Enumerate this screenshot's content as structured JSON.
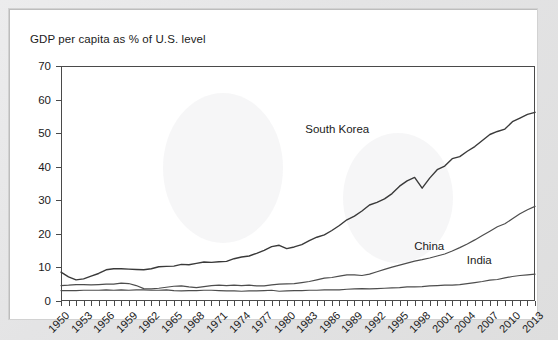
{
  "chart_data": {
    "type": "line",
    "title": "GDP per capita as % of U.S. level",
    "xlabel": "",
    "ylabel": "",
    "ylim": [
      0,
      70
    ],
    "xlim": [
      1950,
      2013
    ],
    "ytick_step": 10,
    "yticks": [
      0,
      10,
      20,
      30,
      40,
      50,
      60,
      70
    ],
    "xticks": [
      1950,
      1953,
      1956,
      1959,
      1962,
      1965,
      1968,
      1971,
      1974,
      1977,
      1980,
      1983,
      1986,
      1989,
      1992,
      1995,
      1998,
      2001,
      2004,
      2007,
      2010,
      2013
    ],
    "xtick_every_year": true,
    "grid": false,
    "legend": "inline-labels",
    "x": [
      1950,
      1951,
      1952,
      1953,
      1954,
      1955,
      1956,
      1957,
      1958,
      1959,
      1960,
      1961,
      1962,
      1963,
      1964,
      1965,
      1966,
      1967,
      1968,
      1969,
      1970,
      1971,
      1972,
      1973,
      1974,
      1975,
      1976,
      1977,
      1978,
      1979,
      1980,
      1981,
      1982,
      1983,
      1984,
      1985,
      1986,
      1987,
      1988,
      1989,
      1990,
      1991,
      1992,
      1993,
      1994,
      1995,
      1996,
      1997,
      1998,
      1999,
      2000,
      2001,
      2002,
      2003,
      2004,
      2005,
      2006,
      2007,
      2008,
      2009,
      2010,
      2011,
      2012,
      2013
    ],
    "series": [
      {
        "name": "South Korea",
        "label_x": 1987,
        "label_y": 51,
        "values": [
          8.6,
          7.2,
          6.3,
          6.6,
          7.4,
          8.2,
          9.3,
          9.6,
          9.6,
          9.5,
          9.4,
          9.3,
          9.6,
          10.2,
          10.3,
          10.4,
          10.9,
          10.8,
          11.2,
          11.6,
          11.5,
          11.7,
          11.8,
          12.6,
          13.1,
          13.4,
          14.2,
          15.1,
          16.2,
          16.6,
          15.6,
          16.1,
          16.8,
          18.0,
          19.0,
          19.7,
          21.0,
          22.5,
          24.2,
          25.3,
          26.8,
          28.6,
          29.4,
          30.4,
          32.0,
          34.2,
          35.8,
          36.8,
          33.6,
          36.6,
          39.1,
          40.2,
          42.4,
          43.0,
          44.6,
          46.0,
          47.8,
          49.6,
          50.5,
          51.2,
          53.4,
          54.5,
          55.6,
          56.2
        ]
      },
      {
        "name": "China",
        "label_x": 1999,
        "label_y": 16,
        "values": [
          4.6,
          4.7,
          4.9,
          4.9,
          4.8,
          4.9,
          5.0,
          5.0,
          5.3,
          5.2,
          4.6,
          3.7,
          3.6,
          3.8,
          4.1,
          4.4,
          4.5,
          4.2,
          4.0,
          4.3,
          4.6,
          4.7,
          4.6,
          4.7,
          4.6,
          4.7,
          4.5,
          4.5,
          4.8,
          5.0,
          5.1,
          5.2,
          5.5,
          5.8,
          6.3,
          6.8,
          7.0,
          7.4,
          7.8,
          7.8,
          7.6,
          8.0,
          8.7,
          9.4,
          10.1,
          10.7,
          11.3,
          11.9,
          12.3,
          12.8,
          13.4,
          14.0,
          14.9,
          15.9,
          17.0,
          18.2,
          19.5,
          20.8,
          22.1,
          23.0,
          24.5,
          26.0,
          27.2,
          28.2
        ]
      },
      {
        "name": "India",
        "label_x": 2006,
        "label_y": 12,
        "values": [
          3.1,
          3.1,
          3.1,
          3.2,
          3.2,
          3.2,
          3.3,
          3.2,
          3.3,
          3.2,
          3.3,
          3.3,
          3.2,
          3.2,
          3.3,
          3.1,
          3.0,
          3.1,
          3.1,
          3.2,
          3.2,
          3.1,
          3.0,
          3.0,
          2.9,
          3.0,
          3.0,
          3.1,
          3.2,
          2.9,
          3.0,
          3.1,
          3.1,
          3.2,
          3.2,
          3.3,
          3.3,
          3.3,
          3.5,
          3.6,
          3.7,
          3.6,
          3.7,
          3.8,
          3.9,
          4.0,
          4.2,
          4.2,
          4.3,
          4.5,
          4.6,
          4.7,
          4.7,
          4.9,
          5.2,
          5.5,
          5.8,
          6.2,
          6.4,
          6.9,
          7.3,
          7.6,
          7.8,
          8.0
        ]
      }
    ]
  },
  "colors": {
    "line": "#3a3a3a",
    "axis": "#4a4a4a",
    "text": "#1b1b1b",
    "panel": "#ffffff",
    "frame": "#e4e4e5"
  }
}
